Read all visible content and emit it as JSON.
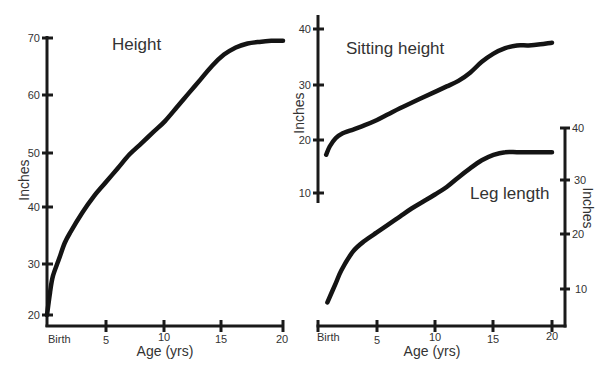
{
  "chart_data": [
    {
      "id": "height",
      "type": "line",
      "title": "Height",
      "xlabel": "Age (yrs)",
      "ylabel": "Inches",
      "x_tick_labels": [
        "Birth",
        "5",
        "10",
        "15",
        "20"
      ],
      "x_ticks": [
        0,
        5,
        10,
        15,
        20
      ],
      "y_ticks": [
        20,
        30,
        40,
        50,
        60,
        70
      ],
      "xlim": [
        0,
        20
      ],
      "ylim": [
        20,
        70
      ],
      "y_axis_position": "left",
      "grid": false,
      "x": [
        0,
        0.25,
        0.5,
        1,
        1.5,
        2,
        3,
        4,
        5,
        6,
        7,
        8,
        9,
        10,
        11,
        12,
        13,
        14,
        15,
        16,
        17,
        18,
        19,
        20
      ],
      "values": [
        20,
        24,
        27,
        30,
        33,
        35,
        38.5,
        41.5,
        44,
        46.5,
        49,
        51,
        53,
        55,
        57.5,
        60,
        62.5,
        65,
        67,
        68.3,
        69,
        69.3,
        69.5,
        69.5
      ]
    },
    {
      "id": "sitting_height",
      "type": "line",
      "title": "Sitting height",
      "xlabel": "",
      "ylabel": "Inches",
      "y_ticks": [
        10,
        20,
        30,
        40
      ],
      "xlim": [
        0,
        20
      ],
      "ylim": [
        10,
        40
      ],
      "y_axis_position": "left",
      "grid": false,
      "x": [
        0.7,
        1,
        1.5,
        2,
        3,
        4,
        5,
        6,
        7,
        8,
        9,
        10,
        11,
        12,
        13,
        14,
        15,
        16,
        17,
        18,
        19,
        20
      ],
      "values": [
        17,
        18.5,
        20,
        20.8,
        21.6,
        22.4,
        23.3,
        24.4,
        25.5,
        26.5,
        27.5,
        28.5,
        29.5,
        30.5,
        32,
        34,
        35.5,
        36.5,
        37,
        37,
        37.2,
        37.5
      ]
    },
    {
      "id": "leg_length",
      "type": "line",
      "title": "Leg length",
      "xlabel": "Age (yrs)",
      "ylabel": "Inches",
      "x_tick_labels": [
        "Birth",
        "5",
        "10",
        "15",
        "20"
      ],
      "x_ticks": [
        0,
        5,
        10,
        15,
        20
      ],
      "y_ticks": [
        10,
        20,
        30,
        40
      ],
      "xlim": [
        0,
        20
      ],
      "ylim": [
        0,
        40
      ],
      "y_axis_position": "right",
      "grid": false,
      "x": [
        0.8,
        1.5,
        2,
        3,
        4,
        5,
        6,
        7,
        8,
        9,
        10,
        11,
        12,
        13,
        14,
        15,
        16,
        17,
        18,
        19,
        20
      ],
      "values": [
        7.5,
        11,
        13.5,
        17,
        19,
        20.5,
        22,
        23.5,
        25,
        26.3,
        27.6,
        29,
        30.8,
        32.5,
        34,
        35,
        35.5,
        35.5,
        35.5,
        35.5,
        35.5
      ]
    }
  ],
  "labels": {
    "height_title": "Height",
    "sitting_title": "Sitting height",
    "leg_title": "Leg length",
    "x_axis_label": "Age (yrs)",
    "y_axis_label": "Inches",
    "birth": "Birth",
    "x5": "5",
    "x10": "10",
    "x15": "15",
    "x20": "20",
    "y70": "70",
    "y60": "60",
    "y50": "50",
    "y40": "40",
    "y30": "30",
    "y20": "20",
    "y10": "10"
  }
}
